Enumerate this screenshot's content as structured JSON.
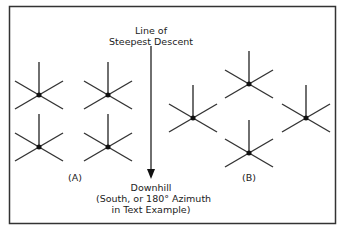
{
  "labels": {
    "arrow_top_1": "Line of",
    "arrow_top_2": "Steepest Descent",
    "group_a": "(A)",
    "group_b": "(B)",
    "downhill_1": "Downhill",
    "downhill_2": "(South, or 180° Azimuth",
    "downhill_3": "in Text  Example)"
  },
  "colors": {
    "line": "#333333",
    "border": "#333333"
  }
}
